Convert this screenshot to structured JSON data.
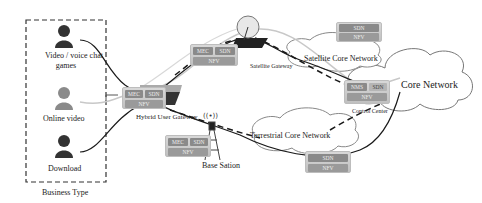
{
  "business_type": {
    "title": "Business Type",
    "items": [
      {
        "label_line1": "Video / voice chat",
        "label_line2": "games",
        "icon": "person-icon",
        "color": "#333333"
      },
      {
        "label_line1": "Online video",
        "label_line2": "",
        "icon": "person-icon",
        "color": "#8a8a8a"
      },
      {
        "label_line1": "Download",
        "label_line2": "",
        "icon": "person-icon",
        "color": "#333333"
      }
    ]
  },
  "nodes": {
    "hybrid_gateway": {
      "label": "Hybrid User Gateway",
      "cells": [
        "MEC",
        "SDN",
        "NFV"
      ]
    },
    "satellite_gateway": {
      "label": "Satellite Gateway",
      "cells": [
        "MEC",
        "SDN",
        "NFV"
      ]
    },
    "base_station": {
      "label": "Base Sation",
      "cells": [
        "MEC",
        "SDN",
        "NFV"
      ]
    },
    "satellite_core": {
      "label": "Satellite Core Network",
      "cells": [
        "SDN",
        "NFV"
      ]
    },
    "terrestrial_core": {
      "label": "Terrestrial Core Network",
      "cells": [
        "SDN",
        "NFV"
      ]
    },
    "control_center": {
      "label": "Control Center",
      "cells": [
        "NMS",
        "SDN",
        "NFV"
      ]
    },
    "core_network": {
      "label": "Core Network"
    }
  },
  "colors": {
    "cell_dark": "#8a8a8a",
    "cell_nfv": "#9a9a9a",
    "line_dark": "#1a1a1a",
    "line_light": "#c8c8c8"
  }
}
